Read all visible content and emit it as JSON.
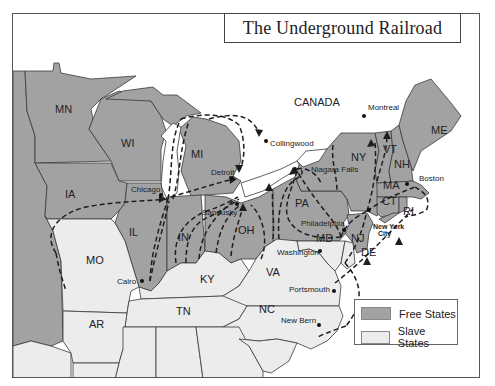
{
  "title": "The Underground Railroad",
  "colors": {
    "free_states": "#a2a2a2",
    "slave_states": "#ececec",
    "water": "#ffffff",
    "routes": "#1e1e1e"
  },
  "region_labels": {
    "canada": "CANADA"
  },
  "free_states": [
    "MN",
    "WI",
    "MI",
    "IA",
    "IL",
    "IN",
    "OH",
    "PA",
    "NY",
    "VT",
    "NH",
    "ME",
    "MA",
    "CT",
    "RI",
    "NJ"
  ],
  "slave_states": [
    "MO",
    "KY",
    "VA",
    "TN",
    "AR",
    "NC",
    "MD",
    "DE"
  ],
  "state_labels": {
    "MN": "MN",
    "WI": "WI",
    "MI": "MI",
    "IA": "IA",
    "IL": "IL",
    "IN": "IN",
    "OH": "OH",
    "PA": "PA",
    "NY": "NY",
    "VT": "VT",
    "NH": "NH",
    "ME": "ME",
    "MA": "MA",
    "CT": "CT",
    "RI": "RI",
    "NJ": "NJ",
    "MD": "MD",
    "DE": "DE",
    "MO": "MO",
    "KY": "KY",
    "VA": "VA",
    "TN": "TN",
    "AR": "AR",
    "NC": "NC"
  },
  "cities": {
    "montreal": "Montreal",
    "collingwood": "Collingwood",
    "detroit": "Detroit",
    "chicago": "Chicago",
    "niagara_falls": "Niagara Falls",
    "sandusky": "Sandusky",
    "boston": "Boston",
    "philadelphia": "Philadelphia",
    "new_york_city_line1": "New York",
    "new_york_city_line2": "City",
    "washington": "Washington",
    "cairo": "Cairo",
    "portsmouth": "Portsmouth",
    "new_bern": "New Bern"
  },
  "legend": {
    "items": [
      {
        "label": "Free States",
        "color": "#a2a2a2"
      },
      {
        "label": "Slave States",
        "color": "#ececec"
      }
    ]
  }
}
